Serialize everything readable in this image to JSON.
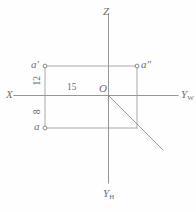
{
  "figure": {
    "type": "engineering-drawing",
    "stroke_color": "#8a8a8a",
    "text_color": "#6e6e6e",
    "background": "#fefefe"
  },
  "axes": [
    {
      "id": "x",
      "label": "X",
      "sub": "",
      "direction": "left"
    },
    {
      "id": "z",
      "label": "Z",
      "sub": "",
      "direction": "up"
    },
    {
      "id": "yw",
      "label": "Y",
      "sub": "W",
      "direction": "right"
    },
    {
      "id": "yh",
      "label": "Y",
      "sub": "H",
      "direction": "down"
    }
  ],
  "origin": {
    "label": "O"
  },
  "points": [
    {
      "id": "a_front",
      "label": "a′",
      "position": "top-left",
      "marker": "circle"
    },
    {
      "id": "a_side",
      "label": "a″",
      "position": "top-right",
      "marker": "circle"
    },
    {
      "id": "a_top",
      "label": "a",
      "position": "bottom-left",
      "marker": "circle"
    }
  ],
  "dimensions": [
    {
      "id": "dim-12",
      "value": "12",
      "orientation": "vertical",
      "location": "above-x-axis"
    },
    {
      "id": "dim-15",
      "value": "15",
      "orientation": "horizontal",
      "location": "along-x-axis"
    },
    {
      "id": "dim-8",
      "value": "8",
      "orientation": "vertical",
      "location": "below-x-axis"
    }
  ]
}
